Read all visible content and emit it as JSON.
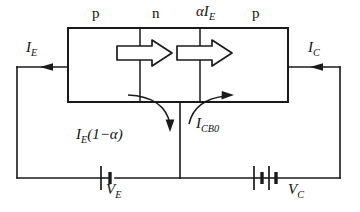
{
  "figure": {
    "type": "circuit-diagram",
    "stroke_color": "#1a1a1a",
    "background_color": "#ffffff"
  },
  "labels": {
    "region_p_left": "p",
    "region_n": "n",
    "alpha_ie": "αI",
    "alpha_ie_sub": "E",
    "region_p_right": "p",
    "emitter_current": "I",
    "emitter_current_sub": "E",
    "collector_current": "I",
    "collector_current_sub": "C",
    "base_current": "I",
    "base_current_sub": "E",
    "base_current_tail": "(1−α)",
    "leakage_current": "I",
    "leakage_current_sub": "CB0",
    "emitter_supply": "V",
    "emitter_supply_sub": "E",
    "collector_supply": "V",
    "collector_supply_sub": "C"
  },
  "geometry": {
    "outer_loop": {
      "left": 17,
      "right": 340,
      "top": 67,
      "bottom": 178
    },
    "transistor_box": {
      "left": 68,
      "top": 28,
      "right": 288,
      "bottom": 102
    },
    "junction_x": [
      140,
      200
    ],
    "base_wire_x": 180,
    "emitter_battery_x": 108,
    "collector_battery_x": 262
  },
  "arrows": {
    "emitter_arrow": "arrow-right",
    "collector_arrow": "arrow-right",
    "drift_arrow_1": "block-arrow-right",
    "drift_arrow_2": "block-arrow-right",
    "base_curve": "curved-arrow-down",
    "leakage_curve": "curved-arrow-up-right"
  }
}
